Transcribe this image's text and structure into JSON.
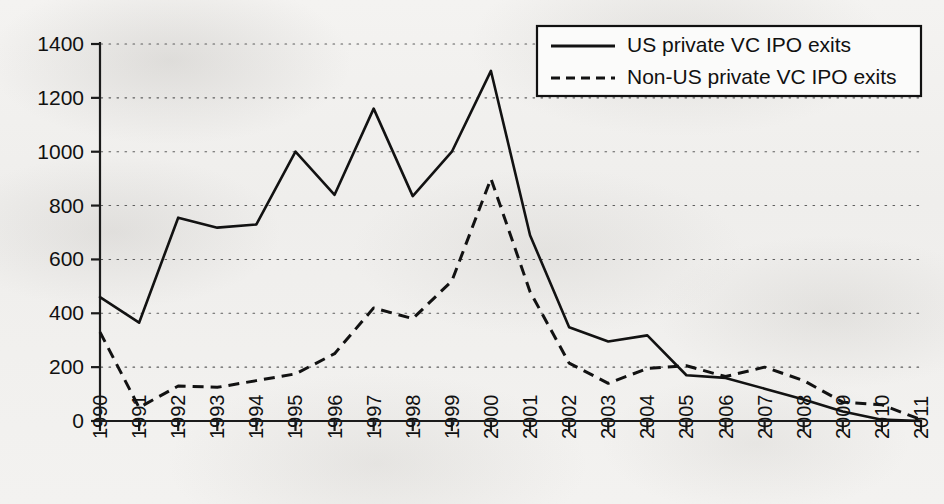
{
  "chart_data": {
    "type": "line",
    "title": "",
    "xlabel": "",
    "ylabel": "",
    "grid": true,
    "legend_position": "top-right",
    "xlim": [
      1990,
      2011
    ],
    "ylim": [
      0,
      1400
    ],
    "ytick_step": 200,
    "categories": [
      "1990",
      "1991",
      "1992",
      "1993",
      "1994",
      "1995",
      "1996",
      "1997",
      "1998",
      "1999",
      "2000",
      "2001",
      "2002",
      "2003",
      "2004",
      "2005",
      "2006",
      "2007",
      "2008",
      "2009",
      "2010",
      "2011"
    ],
    "yticks": [
      "0",
      "200",
      "400",
      "600",
      "800",
      "1000",
      "1200",
      "1400"
    ],
    "series": [
      {
        "name": "US private VC IPO exits",
        "style": "solid",
        "color": "#121212",
        "values": [
          460,
          365,
          755,
          718,
          730,
          1000,
          840,
          1160,
          835,
          1000,
          1300,
          690,
          348,
          295,
          318,
          170,
          160,
          120,
          80,
          35,
          5,
          0
        ]
      },
      {
        "name": "Non-US private VC IPO exits",
        "style": "dashed",
        "color": "#121212",
        "values": [
          330,
          50,
          130,
          125,
          150,
          175,
          250,
          420,
          380,
          520,
          900,
          480,
          215,
          140,
          195,
          205,
          165,
          200,
          150,
          70,
          60,
          5
        ]
      }
    ]
  },
  "legend": {
    "items": [
      {
        "label": "US private VC IPO exits",
        "style": "solid"
      },
      {
        "label": "Non-US private VC IPO exits",
        "style": "dashed"
      }
    ]
  }
}
